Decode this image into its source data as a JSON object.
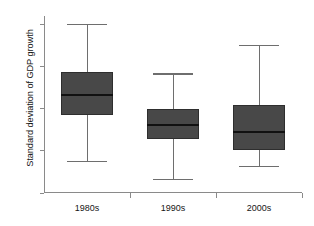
{
  "chart_data": {
    "type": "box",
    "title": "",
    "xlabel": "",
    "ylabel": "Standard deviation of GDP growth",
    "categories": [
      "1980s",
      "1990s",
      "2000s"
    ],
    "ylim": [
      0,
      8.4
    ],
    "yticks": [
      0,
      2,
      4,
      6,
      8
    ],
    "ytick_labels": [
      "0",
      "2",
      "4",
      "6",
      "8"
    ],
    "grid": false,
    "legend": false,
    "box_color": "#484848",
    "median_color": "#111111",
    "whisker_color": "#6e6e6e",
    "axis_color": "#8a8a8a",
    "boxes": [
      {
        "category": "1980s",
        "whisker_low": 1.5,
        "q1": 3.7,
        "median": 4.65,
        "q3": 5.75,
        "whisker_high": 8.0
      },
      {
        "category": "1990s",
        "whisker_low": 0.65,
        "q1": 2.55,
        "median": 3.25,
        "q3": 4.0,
        "whisker_high": 5.65
      },
      {
        "category": "2000s",
        "whisker_low": 1.25,
        "q1": 2.05,
        "median": 2.9,
        "q3": 4.2,
        "whisker_high": 7.0
      }
    ]
  }
}
